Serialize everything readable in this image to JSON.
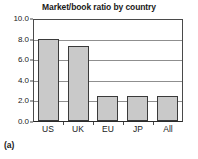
{
  "caption": "(a)",
  "chart_data": {
    "type": "bar",
    "title": "Market/book ratio by country",
    "xlabel": "",
    "ylabel": "",
    "categories": [
      "US",
      "UK",
      "EU",
      "JP",
      "All"
    ],
    "values": [
      8.0,
      7.3,
      2.4,
      2.4,
      2.4
    ],
    "ylim": [
      0.0,
      10.0
    ],
    "yticks": [
      0.0,
      2.0,
      4.0,
      6.0,
      8.0,
      10.0
    ],
    "ytick_labels": [
      "0.0",
      "2.0",
      "4.0",
      "6.0",
      "8.0",
      "10.0"
    ],
    "grid": true,
    "legend": null,
    "legend_position": "none",
    "bar_color": "#c9c9c9",
    "bar_edge_color": "#3a3a3a",
    "grid_color": "#8f8f8f",
    "axis_color": "#4a4a4a",
    "background_color": "#ffffff"
  }
}
